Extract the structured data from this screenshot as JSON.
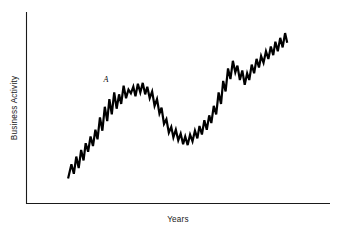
{
  "figure": {
    "background_color": "#ffffff",
    "line_color": "#000000",
    "axis_color": "#1a1a1a"
  },
  "chart_data": {
    "type": "line",
    "title": "",
    "subtitle": "",
    "xlabel": "Years",
    "ylabel": "Business Activity",
    "grid": false,
    "legend": false,
    "legend_position": "none",
    "xlim": [
      0,
      100
    ],
    "ylim": [
      0,
      100
    ],
    "xticks": [],
    "yticks": [],
    "xticklabels": [],
    "yticklabels": [],
    "annotations": [
      {
        "label": "A",
        "style": "italic",
        "x": 25.4,
        "y": 63.5,
        "describes": "peak of first expansion cycle"
      }
    ],
    "series": [
      {
        "name": "Business Activity",
        "color": "#000000",
        "x": [
          13.7,
          14.8,
          15.6,
          16.4,
          17.2,
          18.0,
          18.8,
          19.5,
          20.3,
          21.1,
          21.9,
          22.7,
          23.4,
          24.2,
          25.0,
          25.8,
          26.6,
          27.3,
          28.1,
          28.9,
          29.7,
          30.5,
          31.2,
          32.0,
          32.8,
          33.6,
          34.4,
          35.2,
          35.9,
          36.7,
          37.5,
          38.3,
          39.1,
          39.8,
          40.6,
          41.4,
          42.2,
          43.0,
          43.8,
          44.5,
          45.3,
          46.1,
          46.9,
          47.7,
          48.4,
          49.2,
          50.0,
          50.8,
          51.6,
          52.3,
          53.1,
          53.9,
          54.7,
          55.5,
          56.3,
          57.0,
          57.8,
          58.6,
          59.4,
          60.2,
          60.9,
          61.7,
          62.5,
          63.3,
          64.1,
          64.8,
          65.6,
          66.4,
          67.2,
          68.0,
          68.8,
          69.5,
          70.3,
          71.1,
          71.9,
          72.7,
          73.4,
          74.2,
          75.0,
          75.8,
          76.6,
          77.3,
          78.1,
          78.9,
          79.7,
          80.5,
          81.3,
          82.0,
          82.8,
          83.6,
          84.4,
          85.2,
          85.9
        ],
        "y": [
          13.0,
          20.5,
          15.5,
          24.5,
          18.5,
          28.0,
          22.5,
          31.5,
          27.0,
          35.0,
          30.0,
          38.5,
          33.5,
          45.0,
          38.0,
          50.5,
          43.0,
          54.5,
          46.5,
          58.0,
          49.5,
          57.0,
          52.0,
          61.5,
          55.0,
          59.5,
          57.5,
          61.0,
          56.0,
          62.5,
          58.0,
          63.0,
          57.0,
          61.0,
          55.0,
          58.5,
          51.0,
          54.5,
          47.0,
          50.0,
          41.5,
          44.0,
          37.0,
          40.0,
          34.5,
          38.5,
          33.0,
          36.5,
          31.0,
          35.0,
          30.5,
          36.0,
          32.5,
          38.0,
          34.0,
          40.5,
          36.0,
          43.5,
          38.5,
          46.0,
          42.0,
          51.0,
          46.5,
          58.0,
          52.0,
          64.0,
          58.5,
          70.5,
          65.0,
          74.5,
          68.5,
          72.0,
          64.5,
          69.5,
          62.0,
          68.0,
          64.5,
          72.5,
          68.0,
          75.5,
          71.0,
          77.0,
          73.5,
          79.5,
          75.5,
          82.0,
          77.5,
          84.5,
          79.5,
          86.5,
          81.5,
          89.0,
          84.0
        ]
      }
    ]
  },
  "axes": {
    "y_axis_label": "Business Activity",
    "x_axis_label": "Years"
  }
}
